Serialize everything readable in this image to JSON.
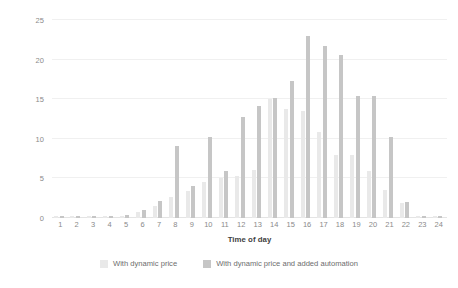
{
  "chart_data": {
    "type": "bar",
    "title": "",
    "xlabel": "Time of day",
    "ylabel": "Reduction in energy usage (%)",
    "categories": [
      "1",
      "2",
      "3",
      "4",
      "5",
      "6",
      "7",
      "8",
      "9",
      "10",
      "11",
      "12",
      "13",
      "14",
      "15",
      "16",
      "17",
      "18",
      "19",
      "20",
      "21",
      "22",
      "23",
      "24"
    ],
    "series": [
      {
        "name": "With dynamic price",
        "color": "#e9e9e9",
        "values": [
          0.3,
          0.3,
          0.2,
          0.2,
          0.3,
          0.8,
          1.5,
          2.6,
          3.4,
          4.5,
          5.0,
          5.3,
          6.1,
          15.0,
          13.8,
          13.5,
          10.8,
          8.0,
          8.0,
          5.9,
          3.6,
          1.9,
          0.2,
          0.2
        ]
      },
      {
        "name": "With dynamic price and added automation",
        "color": "#c6c6c6",
        "values": [
          0.3,
          0.3,
          0.2,
          0.2,
          0.4,
          1.0,
          2.1,
          9.1,
          4.1,
          10.2,
          5.9,
          12.7,
          14.1,
          15.1,
          17.3,
          23.0,
          21.7,
          20.6,
          15.4,
          15.4,
          10.2,
          2.0,
          0.2,
          0.2
        ]
      }
    ],
    "ylim": [
      0,
      25
    ],
    "yticks": [
      0,
      5,
      10,
      15,
      20,
      25
    ],
    "grid": true,
    "legend_position": "bottom"
  }
}
